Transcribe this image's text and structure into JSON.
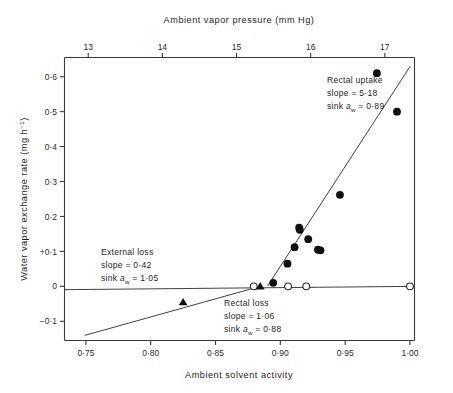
{
  "figure": {
    "background": "#ffffff",
    "ink_color": "#1f1f1f",
    "marker_color": "#101010"
  },
  "axes": {
    "top": {
      "title": "Ambient vapor pressure (mm Hg)",
      "ticks": [
        "13",
        "14",
        "15",
        "16",
        "17"
      ],
      "values": [
        13,
        14,
        15,
        16,
        17
      ],
      "range": [
        12.68,
        17.4
      ]
    },
    "bottom": {
      "title": "Ambient solvent activity",
      "ticks": [
        "0·75",
        "0·80",
        "0·85",
        "0·90",
        "0·95",
        "1·00"
      ],
      "values": [
        0.75,
        0.8,
        0.85,
        0.9,
        0.95,
        1.0
      ],
      "range": [
        0.7335,
        1.0035
      ]
    },
    "left": {
      "title_parts": {
        "main": "Water vapor exchange rate (mg h",
        "superscript": "−1",
        "close": ")"
      },
      "title": "Water vapor exchange rate (mg h⁻¹)",
      "ticks": [
        "0·6",
        "0·5",
        "0·4",
        "0·3",
        "0·2",
        "+0·1",
        "0",
        "−0·1"
      ],
      "values": [
        0.6,
        0.5,
        0.4,
        0.3,
        0.2,
        0.1,
        0.0,
        -0.1
      ],
      "range": [
        -0.155,
        0.655
      ]
    }
  },
  "annotations": [
    {
      "id": "rectal-uptake",
      "line1": "Rectal uptake",
      "line2": "slope = 5·18",
      "line3_prefix": "sink ",
      "line3_symbol": "a",
      "line3_sub": "w",
      "line3_suffix": " = 0·89",
      "slope": 5.18,
      "sink_aw": 0.89
    },
    {
      "id": "external-loss",
      "line1": "External loss",
      "line2": "slope = 0·42",
      "line3_prefix": "sink ",
      "line3_symbol": "a",
      "line3_sub": "w",
      "line3_suffix": " = 1·05",
      "slope": 0.42,
      "sink_aw": 1.05
    },
    {
      "id": "rectal-loss",
      "line1": "Rectal loss",
      "line2": "slope = 1·06",
      "line3_prefix": "sink ",
      "line3_symbol": "a",
      "line3_sub": "w",
      "line3_suffix": " = 0·88",
      "slope": 1.06,
      "sink_aw": 0.88
    }
  ],
  "chart_data": {
    "type": "scatter",
    "title": "",
    "xlabel": "Ambient solvent activity",
    "ylabel": "Water vapor exchange rate (mg h⁻¹)",
    "x2label": "Ambient vapor pressure (mm Hg)",
    "xlim": [
      0.7335,
      1.0035
    ],
    "ylim": [
      -0.155,
      0.655
    ],
    "x2lim": [
      12.68,
      17.4
    ],
    "grid": false,
    "legend": "none",
    "series": [
      {
        "name": "Rectal uptake (filled circles)",
        "marker": "filled-circle",
        "x": [
          0.8945,
          0.9055,
          0.911,
          0.9145,
          0.915,
          0.9215,
          0.929,
          0.931,
          0.946,
          0.9745,
          0.99
        ],
        "y": [
          0.01,
          0.065,
          0.112,
          0.168,
          0.162,
          0.135,
          0.105,
          0.103,
          0.262,
          0.61,
          0.5
        ]
      },
      {
        "name": "External loss (open circles)",
        "marker": "open-circle",
        "x": [
          0.8795,
          0.906,
          0.92,
          1.0
        ],
        "y": [
          0.0,
          0.0,
          0.0,
          0.0
        ]
      },
      {
        "name": "Rectal loss (triangles)",
        "marker": "filled-triangle",
        "x": [
          0.825,
          0.8845
        ],
        "y": [
          -0.0455,
          0.0
        ]
      }
    ],
    "fit_lines": [
      {
        "name": "Rectal uptake fit",
        "slope": 5.18,
        "intercept_x": 0.89,
        "x_start": 0.89,
        "y_start": 0.0,
        "x_end": 1.0,
        "y_end": 0.629
      },
      {
        "name": "External loss fit",
        "slope": 0.42,
        "sink_aw": 1.05,
        "x_start": 0.7335,
        "y_start": -0.0095,
        "x_end": 1.0035,
        "y_end": 0.0
      },
      {
        "name": "Rectal loss fit",
        "slope": 1.06,
        "sink_aw": 0.88,
        "x_start": 0.749,
        "y_start": -0.1405,
        "x_end": 0.8845,
        "y_end": 0.0
      }
    ]
  }
}
